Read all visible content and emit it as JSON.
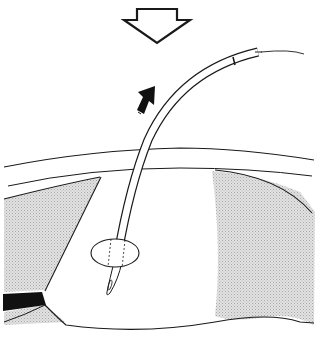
{
  "figure": {
    "title": "",
    "colors": {
      "line": "#1a1a1a",
      "shade": "#cfcfcf",
      "background": "#ffffff",
      "solid_block": "#111111"
    },
    "elements": {
      "open_arrow": "down-arrow-outline",
      "solid_arrow": "up-right-arrow-solid",
      "tube": "curved-tube",
      "cuff": "oval-cuff",
      "upper_layer": "tissue-layer",
      "cavity": "shaded-cavity",
      "black_band": "black-block"
    }
  }
}
